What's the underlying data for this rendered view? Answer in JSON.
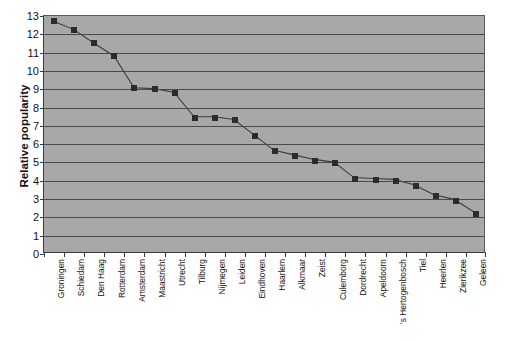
{
  "chart_data": {
    "type": "line",
    "title": "",
    "xlabel": "",
    "ylabel": "Relative popularity",
    "ylim": [
      0,
      13
    ],
    "ytick_step": 1,
    "grid": true,
    "legend": false,
    "legend_position": "none",
    "marker": "square",
    "marker_color": "#2b2b2b",
    "line_color": "#3c3c3c",
    "plot_background": "#a8a8a8",
    "figure_background": "#ffffff",
    "yticks": [
      0,
      1,
      2,
      3,
      4,
      5,
      6,
      7,
      8,
      9,
      10,
      11,
      12,
      13
    ],
    "categories": [
      "Groningen",
      "Schiedam",
      "Den Haag",
      "Rotterdam",
      "Amsterdam",
      "Maastricht",
      "Utrecht",
      "Tilburg",
      "Nijmegen",
      "Leiden",
      "Eindhoven",
      "Haarlem",
      "Alkmaar",
      "Zeist",
      "Culemborg",
      "Dordrecht",
      "Apeldoorn",
      "'s Hertogenbosch",
      "Tiel",
      "Heerlen",
      "Zierikzee",
      "Geleen"
    ],
    "values": [
      12.7,
      12.25,
      11.5,
      10.8,
      9.05,
      9.0,
      8.8,
      7.45,
      7.45,
      7.3,
      6.45,
      5.6,
      5.35,
      5.1,
      4.95,
      4.1,
      4.05,
      4.0,
      3.7,
      3.15,
      2.9,
      2.2
    ]
  }
}
